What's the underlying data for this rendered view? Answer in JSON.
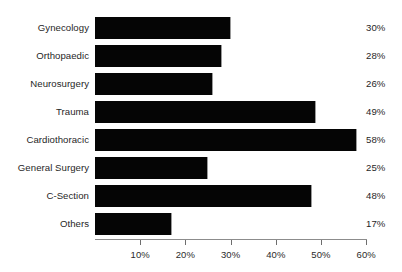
{
  "chart_data": {
    "type": "bar",
    "orientation": "horizontal",
    "title": "",
    "subtitle": "",
    "xlabel": "",
    "ylabel": "",
    "xlim": [
      0,
      62
    ],
    "grid": false,
    "legend": null,
    "axis_color": "#8c8c8c",
    "bar_color": "#050505",
    "text_color": "#1f1f1f",
    "background": "#ffffff",
    "categories": [
      "Gynecology",
      "Orthopaedic",
      "Neurosurgery",
      "Trauma",
      "Cardiothoracic",
      "General Surgery",
      "C-Section",
      "Others"
    ],
    "values": [
      30,
      28,
      26,
      49,
      58,
      25,
      48,
      17
    ],
    "value_labels": [
      "30%",
      "28%",
      "26%",
      "49%",
      "58%",
      "25%",
      "48%",
      "17%"
    ],
    "xticks": [
      10,
      20,
      30,
      40,
      50,
      60
    ],
    "xtick_labels": [
      "10%",
      "20%",
      "30%",
      "40%",
      "50%",
      "60%"
    ]
  }
}
